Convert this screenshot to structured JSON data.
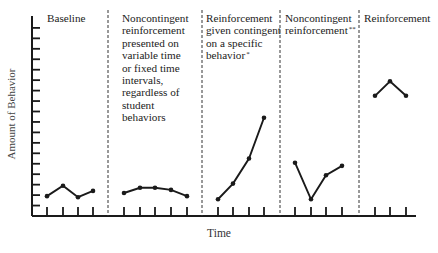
{
  "chart_data": {
    "type": "line",
    "title": "",
    "xlabel": "Time",
    "ylabel": "Amount of Behavior",
    "y_ticks_count": 18,
    "y_tick_labels": [],
    "x_tick_labels": [],
    "ylim": [
      0,
      19
    ],
    "grid": false,
    "legend": "none",
    "phase_separator_style": "dashed vertical",
    "phases": [
      {
        "name": "Baseline",
        "label_lines": [
          "Baseline"
        ],
        "footnote": "",
        "x": [
          1,
          2,
          3,
          4
        ],
        "values": [
          1.9,
          2.9,
          1.8,
          2.4
        ]
      },
      {
        "name": "Noncontingent reinforcement (time-based)",
        "label_lines": [
          "Noncontingent",
          "reinforcement",
          "presented on",
          "variable time",
          "or fixed time",
          "intervals,",
          "regardless of",
          "student",
          "behaviors"
        ],
        "footnote": "",
        "x": [
          5,
          6,
          7,
          8,
          9
        ],
        "values": [
          2.2,
          2.7,
          2.7,
          2.5,
          1.9
        ]
      },
      {
        "name": "Reinforcement given contingent on a specific behavior",
        "label_lines": [
          "Reinforcement",
          "given contingent",
          "on a specific",
          "behavior"
        ],
        "footnote": "*",
        "x": [
          10,
          11,
          12,
          13
        ],
        "values": [
          1.6,
          3.1,
          5.5,
          9.4
        ]
      },
      {
        "name": "Noncontingent reinforcement",
        "label_lines": [
          "Noncontingent",
          "reinforcement"
        ],
        "footnote": "**",
        "x": [
          14,
          15,
          16,
          17
        ],
        "values": [
          5.1,
          1.6,
          3.9,
          4.8
        ]
      },
      {
        "name": "Reinforcement",
        "label_lines": [
          "Reinforcement"
        ],
        "footnote": "",
        "x": [
          18,
          19,
          20
        ],
        "values": [
          11.5,
          12.9,
          11.5
        ]
      }
    ]
  },
  "layout": {
    "axis_color": "#1a1a1a",
    "line_color": "#1a1a1a",
    "divider_color": "#333333"
  }
}
